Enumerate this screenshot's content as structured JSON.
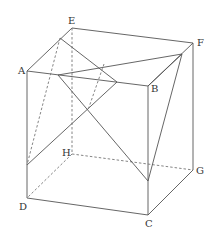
{
  "diagram": {
    "vertices": {
      "A": {
        "label": "A",
        "x": 27,
        "y": 71
      },
      "B": {
        "label": "B",
        "x": 148,
        "y": 86
      },
      "C": {
        "label": "C",
        "x": 148,
        "y": 215
      },
      "D": {
        "label": "D",
        "x": 27,
        "y": 198
      },
      "E": {
        "label": "E",
        "x": 72,
        "y": 28
      },
      "F": {
        "label": "F",
        "x": 193,
        "y": 43
      },
      "G": {
        "label": "G",
        "x": 193,
        "y": 170
      },
      "H": {
        "label": "H",
        "x": 72,
        "y": 154
      }
    },
    "labels": {
      "A": "A",
      "B": "B",
      "C": "C",
      "D": "D",
      "E": "E",
      "F": "F",
      "G": "G",
      "H": "H"
    },
    "colors": {
      "line": "#555555",
      "hidden_line": "#777777",
      "label": "#333333",
      "background": "#ffffff"
    }
  }
}
